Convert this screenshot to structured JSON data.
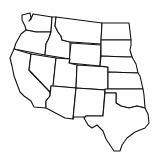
{
  "map": {
    "title": "Western United States outline map",
    "stroke_color": "#111111",
    "fill_color": "#ffffff",
    "states": [
      {
        "name": "Washington",
        "points": "22,15 30,13 31,18 29,21 31,19 33,14 52,17 51,32 36,32 26,30 25,26 22,20"
      },
      {
        "name": "Oregon",
        "points": "26,30 36,32 51,32 49,38 46,44 45,55 14,49 16,43 21,34"
      },
      {
        "name": "California",
        "points": "14,49 31,54 29,70 50,92 50,96 46,101 46,108 34,107 31,101 24,96 20,92 17,84 14,76 12,66 10,58"
      },
      {
        "name": "Idaho",
        "points": "52,17 56,17 55,26 58,32 61,36 62,40 70,42 70,59 45,55 46,44 49,38 51,32"
      },
      {
        "name": "Nevada",
        "points": "31,54 56,58 53,87 51,86 50,92 29,70"
      },
      {
        "name": "Montana",
        "points": "56,17 102,23 101,44 71,42 70,42 62,40 61,36 58,32 55,26"
      },
      {
        "name": "Wyoming",
        "points": "71,43 101,45 100,66 69,63"
      },
      {
        "name": "Utah",
        "points": "56,58 70,59 69,63 77,65 76,88 53,86"
      },
      {
        "name": "Colorado",
        "points": "77,65 108,67 108,90 76,88"
      },
      {
        "name": "Arizona",
        "points": "53,86 76,88 73,119 65,118 46,108 46,101 50,96 51,86"
      },
      {
        "name": "New Mexico",
        "points": "76,88 105,90 103,116 86,116 86,117 74,117 73,119"
      },
      {
        "name": "North Dakota",
        "points": "102,23 129,23 130,31 131,40 101,40"
      },
      {
        "name": "South Dakota",
        "points": "101,40 131,40 131,45 130,50 132,57 126,57 101,56"
      },
      {
        "name": "Nebraska",
        "points": "101,56 126,57 132,57 136,64 138,73 108,72 108,67 100,66"
      },
      {
        "name": "Kansas",
        "points": "108,72 138,73 140,76 143,89 108,89"
      },
      {
        "name": "Oklahoma",
        "points": "105,89 143,89 144,95 145,108 137,106 129,108 121,106 116,103 116,93 105,93"
      },
      {
        "name": "Texas",
        "points": "105,93 116,93 116,103 121,106 129,108 137,106 145,108 148,114 149,123 145,128 135,132 127,138 122,145 120,151 114,151 110,145 106,139 103,131 97,125 92,128 88,125 84,118 86,116 103,116"
      }
    ]
  }
}
